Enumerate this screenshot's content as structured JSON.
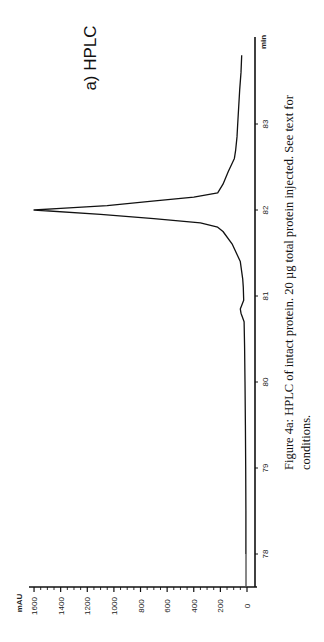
{
  "panel_title": "a) HPLC",
  "caption": {
    "line1": "Figure 4a: HPLC of intact protein. 20 µg total protein injected.  See text for",
    "line2": "conditions."
  },
  "axes": {
    "x_unit": "min",
    "y_unit": "mAU",
    "x_ticks": [
      "78",
      "79",
      "80",
      "81",
      "82",
      "83"
    ],
    "y_ticks": [
      "0",
      "200",
      "400",
      "600",
      "800",
      "1000",
      "1200",
      "1400",
      "1600"
    ]
  },
  "chart_data": {
    "type": "line",
    "title": "a) HPLC",
    "xlabel": "min",
    "ylabel": "mAU",
    "orientation": "rotated 90° (time axis vertical, absorbance horizontal)",
    "xlim": [
      77.6,
      83.9
    ],
    "ylim": [
      0,
      1650
    ],
    "grid": false,
    "legend": null,
    "x_ticks": [
      78,
      79,
      80,
      81,
      82,
      83
    ],
    "y_ticks": [
      0,
      200,
      400,
      600,
      800,
      1000,
      1200,
      1400,
      1600
    ],
    "series": [
      {
        "name": "HPLC trace",
        "x": [
          78.0,
          78.5,
          79.0,
          79.5,
          80.0,
          80.4,
          80.7,
          80.8,
          80.85,
          80.95,
          81.1,
          81.2,
          81.4,
          81.6,
          81.75,
          81.8,
          81.85,
          81.9,
          81.95,
          82.0,
          82.02,
          82.05,
          82.1,
          82.15,
          82.2,
          82.3,
          82.45,
          82.6,
          82.7,
          82.85,
          83.0,
          83.2,
          83.4,
          83.6,
          83.8
        ],
        "y": [
          8,
          8,
          10,
          12,
          15,
          18,
          22,
          45,
          50,
          25,
          28,
          32,
          50,
          110,
          180,
          220,
          350,
          700,
          1100,
          1600,
          1400,
          1050,
          730,
          400,
          220,
          180,
          140,
          95,
          85,
          75,
          70,
          62,
          55,
          45,
          40
        ]
      }
    ],
    "annotations": [
      "a) HPLC"
    ],
    "caption": "Figure 4a: HPLC of intact protein. 20 µg total protein injected. See text for conditions."
  }
}
